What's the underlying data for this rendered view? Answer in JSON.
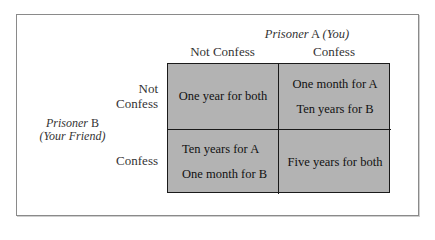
{
  "diagram": {
    "type": "payoff-matrix",
    "column_player": {
      "label_italic": "Prisoner",
      "label_upright": "A",
      "label_note": "(You)",
      "full": "Prisoner A (You)"
    },
    "row_player": {
      "label_italic": "Prisoner",
      "label_upright": "B",
      "label_note": "(Your Friend)",
      "full": "Prisoner B (Your Friend)"
    },
    "columns": [
      "Not Confess",
      "Confess"
    ],
    "rows": [
      {
        "label_line1": "Not",
        "label_line2": "Confess",
        "label": "Not Confess"
      },
      {
        "label_line1": "Confess",
        "label_line2": "",
        "label": "Confess"
      }
    ],
    "cells": [
      [
        {
          "lines": [
            "One year for both"
          ]
        },
        {
          "lines": [
            "One month for A",
            "Ten years for B"
          ]
        }
      ],
      [
        {
          "lines": [
            "Ten years for A",
            "One month for B"
          ]
        },
        {
          "lines": [
            "Five years for both"
          ]
        }
      ]
    ],
    "colors": {
      "cell_fill": "#b3b3b3",
      "grid_lines": "#1a1a1a",
      "frame": "#8a8a8a",
      "background": "#ffffff"
    }
  }
}
